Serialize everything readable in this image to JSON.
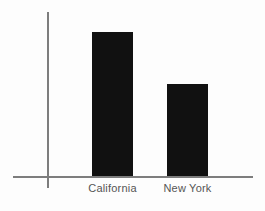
{
  "chart_data": {
    "type": "bar",
    "title": "",
    "subtitle": "",
    "xlabel": "",
    "ylabel": "",
    "categories": [
      "California",
      "New York"
    ],
    "values": [
      135,
      87
    ],
    "series": [
      {
        "name": "",
        "values": [
          135,
          87
        ]
      }
    ],
    "ylim": [
      0,
      165
    ],
    "xlim": null,
    "grid": false,
    "legend": false,
    "legend_position": "none",
    "tick_labels": {
      "x": [
        "California",
        "New York"
      ],
      "y": []
    },
    "annotations": [],
    "colors": {
      "bar_fill": "#111111",
      "axis_line": "#7d7d7d",
      "tick_label": "#555555",
      "background": "#fdfdfd"
    }
  },
  "axes": {
    "x_axis_name": "category-axis",
    "y_axis_name": "value-axis"
  }
}
